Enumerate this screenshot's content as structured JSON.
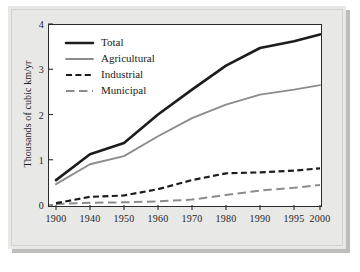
{
  "chart_data": {
    "type": "line",
    "title": "",
    "xlabel": "",
    "ylabel": "Thousands of cubic km/yr",
    "categories": [
      "1900",
      "1940",
      "1950",
      "1960",
      "1970",
      "1980",
      "1990",
      "1995",
      "2000"
    ],
    "x_tick_labels": [
      "1900",
      "1940",
      "1950",
      "1960",
      "1970",
      "1980",
      "1990",
      "1995",
      "2000"
    ],
    "y_tick_labels": [
      "0",
      "1",
      "2",
      "3",
      "4"
    ],
    "y_tick_values": [
      0,
      1,
      2,
      3,
      4
    ],
    "ylim": [
      0,
      4
    ],
    "grid": false,
    "legend_position": "top-left",
    "series": [
      {
        "name": "Total",
        "style": "solid-thick-black",
        "color": "#1c1c1c",
        "values": [
          0.55,
          1.12,
          1.37,
          2.0,
          2.55,
          3.08,
          3.47,
          3.62,
          3.77
        ]
      },
      {
        "name": "Agricultural",
        "style": "solid-gray",
        "color": "#8c8c8c",
        "values": [
          0.46,
          0.9,
          1.08,
          1.52,
          1.92,
          2.22,
          2.44,
          2.55,
          2.65
        ]
      },
      {
        "name": "Industrial",
        "style": "dashed-short-black",
        "color": "#1c1c1c",
        "values": [
          0.04,
          0.18,
          0.21,
          0.35,
          0.55,
          0.7,
          0.72,
          0.76,
          0.81
        ]
      },
      {
        "name": "Municipal",
        "style": "dashed-long-gray",
        "color": "#8c8c8c",
        "values": [
          0.02,
          0.05,
          0.06,
          0.08,
          0.12,
          0.22,
          0.32,
          0.38,
          0.44
        ]
      }
    ]
  },
  "legend": {
    "entries": [
      {
        "label": "Total"
      },
      {
        "label": "Agricultural"
      },
      {
        "label": "Industrial"
      },
      {
        "label": "Municipal"
      }
    ]
  },
  "colors": {
    "panel_background": "#e8e8e6",
    "plot_background": "#ffffff",
    "axis": "#2b2b2b",
    "dark_series": "#1c1c1c",
    "light_series": "#8c8c8c",
    "shadow": "#bdbdbb"
  }
}
